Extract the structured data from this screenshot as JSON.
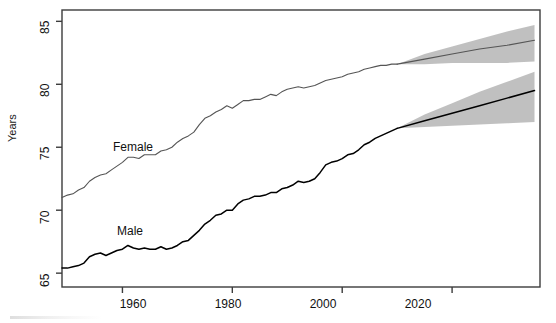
{
  "chart_data": {
    "type": "line",
    "title": "",
    "subtitle": "",
    "xlabel": "",
    "ylabel": "Years",
    "xlim": [
      1949,
      2036
    ],
    "ylim": [
      63.9,
      85.9
    ],
    "grid": false,
    "legend_position": "inline-annotations",
    "xticks": [
      1960,
      1980,
      2000,
      2020
    ],
    "yticks": [
      65,
      70,
      75,
      80,
      85
    ],
    "annotations": [
      {
        "text": "Female",
        "x": 1963,
        "y": 75.2
      },
      {
        "text": "Male",
        "x": 1964,
        "y": 68.6
      }
    ],
    "forecast_start_year": 2010,
    "series": [
      {
        "name": "Female",
        "color": "#555555",
        "kind": "historical",
        "x": [
          1949,
          1950,
          1951,
          1952,
          1953,
          1954,
          1955,
          1956,
          1957,
          1958,
          1959,
          1960,
          1961,
          1962,
          1963,
          1964,
          1965,
          1966,
          1967,
          1968,
          1969,
          1970,
          1971,
          1972,
          1973,
          1974,
          1975,
          1976,
          1977,
          1978,
          1979,
          1980,
          1981,
          1982,
          1983,
          1984,
          1985,
          1986,
          1987,
          1988,
          1989,
          1990,
          1991,
          1992,
          1993,
          1994,
          1995,
          1996,
          1997,
          1998,
          1999,
          2000,
          2001,
          2002,
          2003,
          2004,
          2005,
          2006,
          2007,
          2008,
          2009,
          2010
        ],
        "values": [
          71.0,
          71.2,
          71.3,
          71.6,
          71.8,
          72.3,
          72.6,
          72.8,
          72.9,
          73.2,
          73.5,
          73.8,
          74.2,
          74.2,
          74.1,
          74.4,
          74.4,
          74.4,
          74.7,
          74.8,
          75.0,
          75.4,
          75.7,
          75.9,
          76.2,
          76.8,
          77.3,
          77.5,
          77.8,
          78.0,
          78.3,
          78.1,
          78.4,
          78.7,
          78.7,
          78.8,
          78.8,
          79.0,
          79.2,
          79.1,
          79.4,
          79.6,
          79.7,
          79.8,
          79.7,
          79.8,
          79.9,
          80.1,
          80.3,
          80.4,
          80.5,
          80.6,
          80.8,
          80.9,
          81.0,
          81.2,
          81.3,
          81.4,
          81.5,
          81.5,
          81.6,
          81.6
        ]
      },
      {
        "name": "Male",
        "color": "#000000",
        "kind": "historical",
        "x": [
          1949,
          1950,
          1951,
          1952,
          1953,
          1954,
          1955,
          1956,
          1957,
          1958,
          1959,
          1960,
          1961,
          1962,
          1963,
          1964,
          1965,
          1966,
          1967,
          1968,
          1969,
          1970,
          1971,
          1972,
          1973,
          1974,
          1975,
          1976,
          1977,
          1978,
          1979,
          1980,
          1981,
          1982,
          1983,
          1984,
          1985,
          1986,
          1987,
          1988,
          1989,
          1990,
          1991,
          1992,
          1993,
          1994,
          1995,
          1996,
          1997,
          1998,
          1999,
          2000,
          2001,
          2002,
          2003,
          2004,
          2005,
          2006,
          2007,
          2008,
          2009,
          2010
        ],
        "values": [
          65.4,
          65.4,
          65.5,
          65.6,
          65.8,
          66.3,
          66.5,
          66.6,
          66.4,
          66.6,
          66.8,
          66.9,
          67.2,
          67.0,
          66.9,
          67.0,
          66.9,
          66.9,
          67.1,
          66.9,
          67.0,
          67.2,
          67.5,
          67.6,
          68.0,
          68.4,
          68.9,
          69.2,
          69.6,
          69.7,
          70.0,
          70.0,
          70.5,
          70.8,
          70.9,
          71.1,
          71.1,
          71.2,
          71.4,
          71.4,
          71.7,
          71.8,
          72.0,
          72.3,
          72.2,
          72.3,
          72.5,
          73.0,
          73.6,
          73.8,
          73.9,
          74.1,
          74.4,
          74.5,
          74.8,
          75.2,
          75.4,
          75.7,
          75.9,
          76.1,
          76.3,
          76.5
        ]
      },
      {
        "name": "Female projection",
        "color": "#555555",
        "kind": "forecast",
        "x": [
          2010,
          2015,
          2020,
          2025,
          2030,
          2035
        ],
        "values": [
          81.6,
          82.0,
          82.4,
          82.8,
          83.1,
          83.5
        ],
        "band_lower": [
          81.6,
          81.6,
          81.7,
          81.7,
          81.7,
          81.8
        ],
        "band_upper": [
          81.6,
          82.4,
          83.0,
          83.6,
          84.2,
          84.7
        ]
      },
      {
        "name": "Male projection",
        "color": "#000000",
        "kind": "forecast",
        "x": [
          2010,
          2015,
          2020,
          2025,
          2030,
          2035
        ],
        "values": [
          76.5,
          77.1,
          77.7,
          78.3,
          78.9,
          79.5
        ],
        "band_lower": [
          76.5,
          76.6,
          76.7,
          76.8,
          76.9,
          77.0
        ],
        "band_upper": [
          76.5,
          77.6,
          78.5,
          79.4,
          80.2,
          81.0
        ]
      }
    ],
    "band_color": "#9a9a9a",
    "axis_color": "#3c3c3c"
  },
  "axis": {
    "y_title": "Years",
    "y_tick_labels": [
      "65",
      "70",
      "75",
      "80",
      "85"
    ],
    "x_tick_labels": [
      "1960",
      "1980",
      "2000",
      "2020"
    ]
  },
  "labels": {
    "female": "Female",
    "male": "Male"
  }
}
